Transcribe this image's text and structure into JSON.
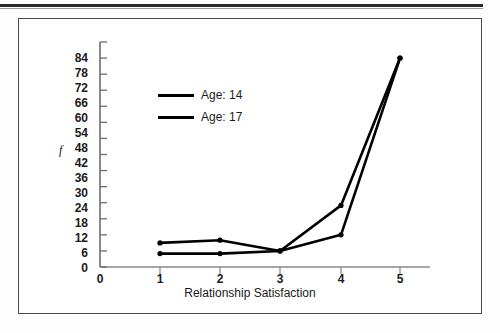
{
  "figure": {
    "border_color": "#4a4a4a",
    "rule_color": "#2b2b2b"
  },
  "axis": {
    "y_label": "f",
    "x_title": "Relationship Satisfaction",
    "y_ticks": [
      "0",
      "6",
      "12",
      "18",
      "24",
      "30",
      "36",
      "42",
      "48",
      "54",
      "60",
      "66",
      "72",
      "78",
      "84"
    ],
    "x_ticks": [
      "1",
      "2",
      "3",
      "4",
      "5"
    ],
    "x_zero_label": "0"
  },
  "legend": {
    "items": [
      {
        "label": "Age: 14",
        "color": "#000000"
      },
      {
        "label": "Age: 17",
        "color": "#000000"
      }
    ]
  },
  "chart_data": {
    "type": "line",
    "title": "",
    "xlabel": "Relationship Satisfaction",
    "ylabel": "f",
    "x": [
      1,
      2,
      3,
      4,
      5
    ],
    "xlim": [
      0,
      5.6
    ],
    "ylim": [
      0,
      84
    ],
    "ytick_step": 6,
    "grid": false,
    "legend_position": "upper-left",
    "markers": "filled-circle",
    "series": [
      {
        "name": "Age: 14",
        "color": "#000000",
        "values": [
          9,
          10,
          6,
          12,
          78
        ]
      },
      {
        "name": "Age: 17",
        "color": "#000000",
        "values": [
          5,
          5,
          6,
          23,
          78
        ]
      }
    ]
  }
}
